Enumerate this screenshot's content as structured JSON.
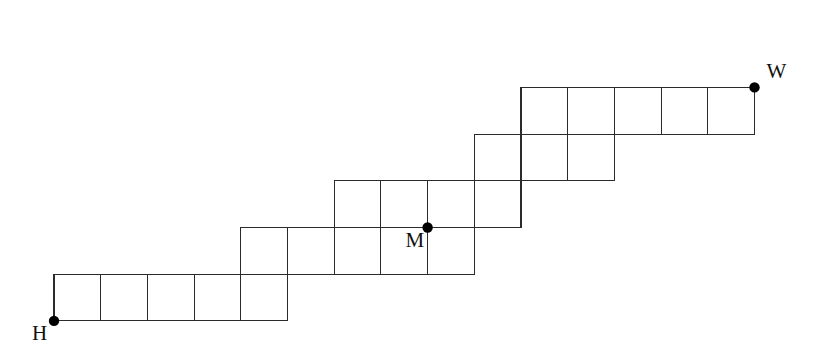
{
  "figure": {
    "kind": "lattice-staircase-diagram",
    "background_color": "#ffffff",
    "line_color": "#2b2b2b",
    "line_width": 1.1,
    "dot_color": "#000000",
    "dot_radius": 5.2,
    "label_color": "#111111",
    "cell_size": 46.7,
    "origin_x": 54,
    "origin_y": 40.7,
    "grid_cols": 16,
    "grid_rows": 7
  },
  "chart_data": {
    "type": "diagram",
    "title": "",
    "xlabel": "",
    "ylabel": "",
    "cells": [
      {
        "col": 0,
        "row": 5
      },
      {
        "col": 1,
        "row": 5
      },
      {
        "col": 2,
        "row": 5
      },
      {
        "col": 3,
        "row": 5
      },
      {
        "col": 4,
        "row": 5
      },
      {
        "col": 4,
        "row": 4
      },
      {
        "col": 5,
        "row": 4
      },
      {
        "col": 6,
        "row": 4
      },
      {
        "col": 7,
        "row": 4
      },
      {
        "col": 8,
        "row": 4
      },
      {
        "col": 6,
        "row": 3
      },
      {
        "col": 7,
        "row": 3
      },
      {
        "col": 8,
        "row": 3
      },
      {
        "col": 9,
        "row": 3
      },
      {
        "col": 9,
        "row": 2
      },
      {
        "col": 10,
        "row": 2
      },
      {
        "col": 11,
        "row": 2
      },
      {
        "col": 10,
        "row": 1
      },
      {
        "col": 11,
        "row": 1
      },
      {
        "col": 12,
        "row": 1
      },
      {
        "col": 13,
        "row": 1
      },
      {
        "col": 14,
        "row": 1
      }
    ],
    "points": [
      {
        "name": "H",
        "label": "H",
        "col": 0,
        "row": 6,
        "label_dx": -22,
        "label_dy": 2
      },
      {
        "name": "M",
        "label": "M",
        "col": 8,
        "row": 4,
        "label_dx": -22,
        "label_dy": 2
      },
      {
        "name": "W",
        "label": "W",
        "col": 15,
        "row": 1,
        "label_dx": 12,
        "label_dy": -26
      }
    ]
  },
  "labels": {
    "h": "H",
    "m": "M",
    "w": "W"
  }
}
